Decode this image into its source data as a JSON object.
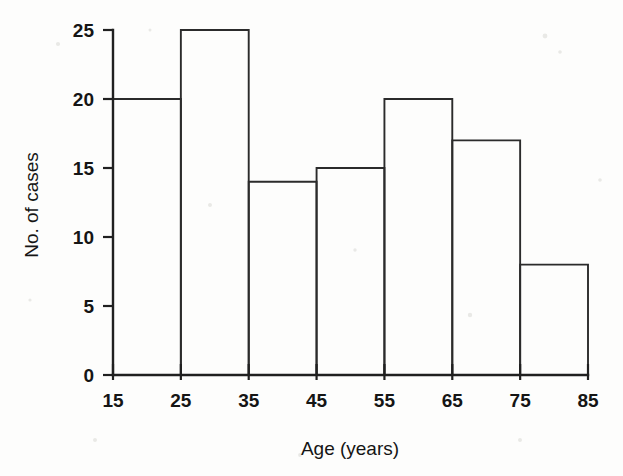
{
  "chart_data": {
    "type": "bar",
    "title": "",
    "subtitle": "",
    "xlabel": "Age (years)",
    "ylabel": "No. of cases",
    "categories": [
      "15-25",
      "25-35",
      "35-45",
      "45-55",
      "55-65",
      "65-75",
      "75-85"
    ],
    "bin_edges": [
      15,
      25,
      35,
      45,
      55,
      65,
      75,
      85
    ],
    "values": [
      20,
      25,
      14,
      15,
      20,
      17,
      8
    ],
    "xlim": [
      15,
      85
    ],
    "ylim": [
      0,
      25
    ],
    "x_ticks": [
      15,
      25,
      35,
      45,
      55,
      65,
      75,
      85
    ],
    "y_ticks": [
      0,
      5,
      10,
      15,
      20,
      25
    ],
    "x_tick_labels": [
      "15",
      "25",
      "35",
      "45",
      "55",
      "65",
      "75",
      "85"
    ],
    "y_tick_labels": [
      "0",
      "5",
      "10",
      "15",
      "20",
      "25"
    ],
    "grid": false,
    "legend": null,
    "legend_position": "none",
    "bar_fill": "none",
    "bar_stroke": "#2b2b2b",
    "axis_color": "#202020",
    "background": "#fdfdfc",
    "annotations": []
  }
}
